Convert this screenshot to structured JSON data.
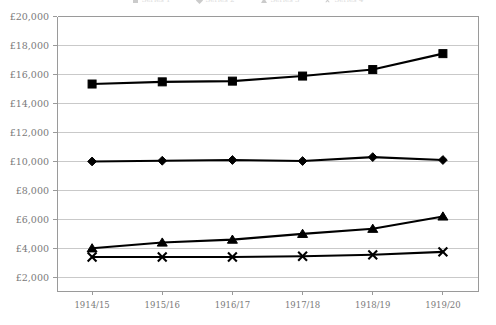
{
  "chart_data": {
    "type": "line",
    "title": "",
    "xlabel": "",
    "ylabel": "",
    "categories": [
      "1914/15",
      "1915/16",
      "1916/17",
      "1917/18",
      "1918/19",
      "1919/20"
    ],
    "ylim": [
      1000,
      20000
    ],
    "ytick_values": [
      2000,
      4000,
      6000,
      8000,
      10000,
      12000,
      14000,
      16000,
      18000,
      20000
    ],
    "ytick_labels": [
      "£2,000",
      "£4,000",
      "£6,000",
      "£8,000",
      "£10,000",
      "£12,000",
      "£14,000",
      "£16,000",
      "£18,000",
      "£20,000"
    ],
    "grid": true,
    "legend_position": "top",
    "currency_symbol": "£",
    "series": [
      {
        "name": "Series 1",
        "marker": "square",
        "color": "#000000",
        "values": [
          15300,
          15450,
          15500,
          15850,
          16300,
          17400
        ]
      },
      {
        "name": "Series 2",
        "marker": "diamond",
        "color": "#000000",
        "values": [
          9950,
          10000,
          10050,
          9980,
          10250,
          10050
        ]
      },
      {
        "name": "Series 3",
        "marker": "triangle",
        "color": "#000000",
        "values": [
          3950,
          4350,
          4550,
          4950,
          5300,
          6150
        ]
      },
      {
        "name": "Series 4",
        "marker": "x",
        "color": "#000000",
        "values": [
          3350,
          3350,
          3350,
          3400,
          3500,
          3700
        ]
      }
    ]
  },
  "legend": {
    "clipped": true,
    "items": [
      {
        "label": "Series 1",
        "marker": "square"
      },
      {
        "label": "Series 2",
        "marker": "diamond"
      },
      {
        "label": "Series 3",
        "marker": "triangle"
      },
      {
        "label": "Series 4",
        "marker": "x"
      }
    ]
  },
  "plot_area": {
    "left": 57,
    "right": 478,
    "top": 16,
    "bottom": 291
  }
}
